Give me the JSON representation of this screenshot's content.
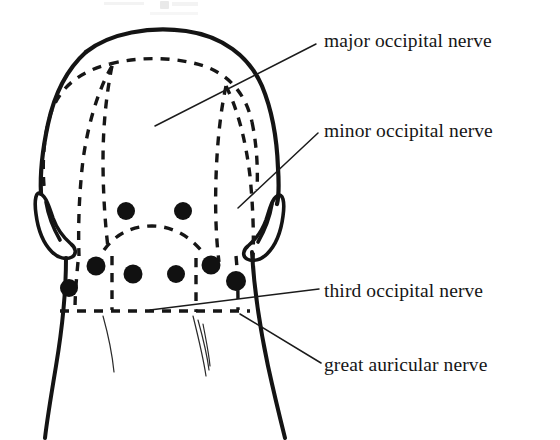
{
  "figure": {
    "title_fragment": "Fig.",
    "ink_color": "#141414",
    "background_color": "#ffffff",
    "marker_color": "#111111"
  },
  "labels": [
    {
      "id": "major-occipital-nerve",
      "text": "major occipital nerve",
      "text_x": 324,
      "text_y": 47,
      "leader": "M 316 44 L 155 126"
    },
    {
      "id": "minor-occipital-nerve",
      "text": "minor occipital nerve",
      "text_x": 324,
      "text_y": 137,
      "leader": "M 318 133 L 238 208"
    },
    {
      "id": "third-occipital-nerve",
      "text": "third occipital nerve",
      "text_x": 324,
      "text_y": 297,
      "leader": "M 319 289 L 150 310"
    },
    {
      "id": "great-auricular-nerve",
      "text": "great auricular nerve",
      "text_x": 324,
      "text_y": 371,
      "leader": "M 321 363 L 240 314"
    }
  ],
  "injection_points": {
    "legend": "black dots mark nerve block injection sites",
    "count": 8,
    "radius": 8.5,
    "points": [
      {
        "id": "upper-left",
        "x": 126,
        "y": 211,
        "r": 9
      },
      {
        "id": "upper-right",
        "x": 183,
        "y": 211,
        "r": 9
      },
      {
        "id": "lower-far-left",
        "x": 69,
        "y": 288,
        "r": 9
      },
      {
        "id": "lower-left-outer",
        "x": 96,
        "y": 266,
        "r": 9.5
      },
      {
        "id": "lower-left-inner",
        "x": 133,
        "y": 274,
        "r": 9.5
      },
      {
        "id": "lower-right-inner",
        "x": 176,
        "y": 274,
        "r": 9
      },
      {
        "id": "lower-right-outer",
        "x": 211,
        "y": 265,
        "r": 9.5
      },
      {
        "id": "lower-far-right",
        "x": 236,
        "y": 281,
        "r": 10
      }
    ]
  },
  "anatomy": {
    "head_outline": "M 86 52 C 110 33 150 26 186 31 C 222 36 249 55 262 86 C 272 110 276 140 277 168 C 278 186 278 198 276 206 C 274 213 270 216 266 214 C 262 212 260 206 259 199 C 259 192 260 186 261 181 C 250 186 243 196 241 207 C 240 216 242 224 245 232 C 248 240 250 250 251 261 C 252 276 253 290 254 302 C 255 316 258 332 263 350 C 268 368 275 388 283 408 C 288 421 292 431 295 438",
    "head_outline_left": "M 86 52 C 66 70 54 96 48 124 C 42 152 40 178 41 196 C 42 206 44 212 48 214 C 52 216 56 212 57 204 C 58 196 57 188 56 182 C 66 186 73 195 76 206 C 78 216 77 226 74 236 C 71 246 69 258 68 270 C 67 286 66 300 65 312 C 64 328 62 346 60 362 C 58 378 56 396 54 412",
    "ear_left": "M 44 196 C 40 188 38 204 40 216 C 42 228 48 240 56 248 C 62 254 70 256 76 254 C 80 252 80 246 76 242 C 70 236 62 228 58 218 C 54 208 50 200 44 196 Z",
    "ear_right": "M 276 196 C 280 188 282 204 280 216 C 278 228 272 240 264 248 C 258 254 250 256 244 254 C 240 252 240 246 244 242 C 250 236 258 228 262 218 C 266 208 270 200 276 196 Z",
    "nerve_territory_outer": "M 48 148 C 52 110 70 82 100 72 C 128 63 164 63 196 72 C 226 81 244 104 250 140 C 254 166 256 194 256 216",
    "nerve_territory_crest": "M 58 120 C 74 92 104 76 146 74 C 190 72 224 86 244 112",
    "nerve_major_left": "M 112 78 C 108 108 106 140 106 172 C 106 206 108 238 112 268",
    "nerve_major_right": "M 222 86 C 218 116 216 148 216 180 C 216 212 218 242 222 272",
    "nerve_minor_left": "M 112 78 C 100 100 92 132 88 168 C 84 200 82 232 82 262",
    "nerve_minor_right": "M 222 86 C 234 108 242 140 246 176 C 250 208 252 238 252 264",
    "nerve_third_arc": "M 104 250 C 116 238 132 228 152 228 C 172 228 188 238 200 252",
    "hairline": "M 62 312 L 252 312",
    "neck_left": "M 68 300 C 66 330 62 364 56 400 C 53 418 50 430 48 438",
    "neck_right": "M 252 300 C 256 330 262 364 270 400 C 276 420 282 432 286 438",
    "hair_strands": [
      "M 106 318 C 110 336 114 354 116 370",
      "M 196 318 C 200 336 204 354 206 372",
      "M 200 322 C 204 340 207 356 208 370",
      "M 204 326 C 207 342 209 356 210 368"
    ]
  },
  "cropped_header": {
    "visible": true,
    "note": "partially cut-off text row from previous page line"
  }
}
